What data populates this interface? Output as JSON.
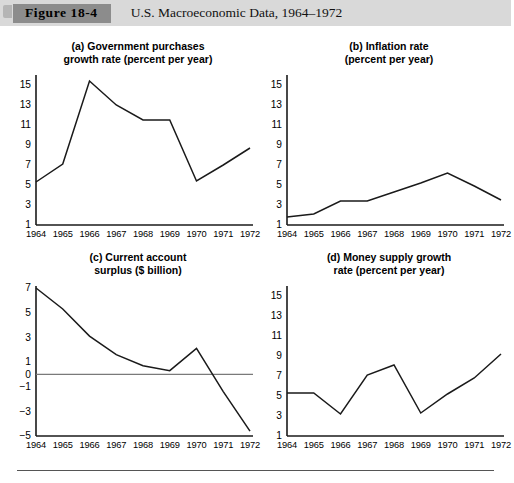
{
  "figure": {
    "tab_label": "Figure 18-4",
    "caption": "U.S. Macroeconomic Data, 1964–1972",
    "band_color": "#d9d9d9",
    "tab_color": "#8c8c8c"
  },
  "chart_data": [
    {
      "id": "a",
      "type": "line",
      "title": "(a) Government purchases\ngrowth rate (percent per year)",
      "xlabel": "",
      "ylabel": "percent per year",
      "categories": [
        1964,
        1965,
        1966,
        1967,
        1968,
        1969,
        1970,
        1971,
        1972
      ],
      "x": [
        "1964",
        "1965",
        "1966",
        "1967",
        "1968",
        "1969",
        "1970",
        "1971",
        "1972"
      ],
      "values": [
        5.3,
        7.1,
        15.4,
        13.0,
        11.5,
        11.5,
        5.4,
        7.0,
        8.7
      ],
      "yticks": [
        1,
        3,
        5,
        7,
        9,
        11,
        13,
        15
      ],
      "ylim": [
        1,
        15.8
      ],
      "grid": false,
      "legend": "none",
      "line_color": "#1a1a1a"
    },
    {
      "id": "b",
      "type": "line",
      "title": "(b) Inflation rate\n(percent per year)",
      "xlabel": "",
      "ylabel": "percent per year",
      "categories": [
        1964,
        1965,
        1966,
        1967,
        1968,
        1969,
        1970,
        1971,
        1972
      ],
      "x": [
        "1964",
        "1965",
        "1966",
        "1967",
        "1968",
        "1969",
        "1970",
        "1971",
        "1972"
      ],
      "values": [
        1.8,
        2.1,
        3.4,
        3.4,
        4.3,
        5.2,
        6.2,
        4.9,
        3.5
      ],
      "yticks": [
        1,
        3,
        5,
        7,
        9,
        11,
        13,
        15
      ],
      "ylim": [
        1,
        15.8
      ],
      "grid": false,
      "legend": "none",
      "line_color": "#1a1a1a"
    },
    {
      "id": "c",
      "type": "line",
      "title": "(c) Current account\nsurplus ($ billion)",
      "xlabel": "",
      "ylabel": "$ billion",
      "categories": [
        1964,
        1965,
        1966,
        1967,
        1968,
        1969,
        1970,
        1971,
        1972
      ],
      "x": [
        "1964",
        "1965",
        "1966",
        "1967",
        "1968",
        "1969",
        "1970",
        "1971",
        "1972"
      ],
      "values": [
        7.0,
        5.3,
        3.1,
        1.6,
        0.7,
        0.3,
        2.1,
        -1.4,
        -4.6
      ],
      "yticks": [
        -5,
        -3,
        -1,
        0,
        1,
        3,
        5,
        7
      ],
      "ylim": [
        -5,
        7
      ],
      "zero_line": 0,
      "grid": false,
      "legend": "none",
      "line_color": "#1a1a1a"
    },
    {
      "id": "d",
      "type": "line",
      "title": "(d) Money supply growth\nrate (percent per year)",
      "xlabel": "",
      "ylabel": "percent per year",
      "categories": [
        1964,
        1965,
        1966,
        1967,
        1968,
        1969,
        1970,
        1971,
        1972
      ],
      "x": [
        "1964",
        "1965",
        "1966",
        "1967",
        "1968",
        "1969",
        "1970",
        "1971",
        "1972"
      ],
      "values": [
        5.3,
        5.3,
        3.2,
        7.1,
        8.1,
        3.3,
        5.2,
        6.8,
        9.2
      ],
      "yticks": [
        1,
        3,
        5,
        7,
        9,
        11,
        13,
        15
      ],
      "ylim": [
        1,
        15.8
      ],
      "grid": false,
      "legend": "none",
      "line_color": "#1a1a1a"
    }
  ]
}
